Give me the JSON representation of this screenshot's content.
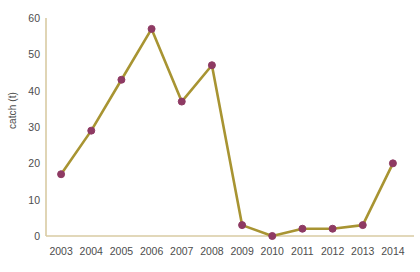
{
  "chart_data": {
    "type": "line",
    "title": "",
    "subtitle": "",
    "xlabel": "",
    "ylabel": "catch (t)",
    "categories": [
      "2003",
      "2004",
      "2005",
      "2006",
      "2007",
      "2008",
      "2009",
      "2010",
      "2011",
      "2012",
      "2013",
      "2014"
    ],
    "values": [
      17,
      29,
      43,
      57,
      37,
      47,
      3,
      0,
      2,
      2,
      3,
      20
    ],
    "series": [
      {
        "name": "catch",
        "values": [
          17,
          29,
          43,
          57,
          37,
          47,
          3,
          0,
          2,
          2,
          3,
          20
        ]
      }
    ],
    "ylim": [
      0,
      60
    ],
    "yticks": [
      0,
      10,
      20,
      30,
      40,
      50,
      60
    ],
    "ytick_labels": [
      "0",
      "10",
      "20",
      "30",
      "40",
      "50",
      "60"
    ],
    "xtick_labels": [
      "2003",
      "2004",
      "2005",
      "2006",
      "2007",
      "2008",
      "2009",
      "2010",
      "2011",
      "2012",
      "2013",
      "2014"
    ],
    "grid": false,
    "legend": false,
    "legend_position": "none",
    "annotations": [],
    "colors": {
      "line": "#a89432",
      "marker": "#8e3a63",
      "marker_edge": "#8e3a63",
      "axis": "#d9cba3",
      "tick_text": "#4d4d4d",
      "background": "#ffffff"
    },
    "marker": "circle",
    "marker_size": 7,
    "line_width": 2.6
  }
}
